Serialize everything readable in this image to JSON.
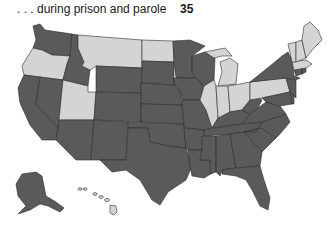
{
  "header": {
    "label": ". . . during prison and parole",
    "value": "35"
  },
  "legend_colors": {
    "dark": "#5a5a5a",
    "light": "#d4d4d4",
    "border": "#2b2b2b"
  },
  "map": {
    "count_dark_states": "35",
    "dark_states": [
      "WA",
      "ID",
      "NV",
      "CA",
      "AZ",
      "NM",
      "WY",
      "CO",
      "SD",
      "NE",
      "KS",
      "OK",
      "TX",
      "MN",
      "IA",
      "MO",
      "AR",
      "LA",
      "WI",
      "KY",
      "TN",
      "MS",
      "AL",
      "GA",
      "FL",
      "SC",
      "NC",
      "VA",
      "WV",
      "MD",
      "DE",
      "NJ",
      "NY",
      "CT",
      "RI",
      "AK"
    ],
    "light_states": [
      "OR",
      "MT",
      "ND",
      "UT",
      "MI",
      "IL",
      "IN",
      "OH",
      "PA",
      "VT",
      "NH",
      "ME",
      "MA",
      "HI"
    ]
  }
}
